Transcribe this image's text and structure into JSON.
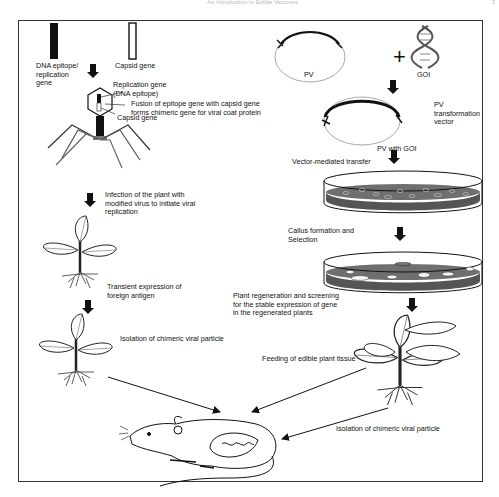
{
  "page": {
    "running_header": "An Introduction to Edible Vaccines",
    "page_number": "3"
  },
  "left_pathway": {
    "dna_epitope_label": [
      "DNA epitope/",
      "replication",
      "gene"
    ],
    "capsid_gene_label": "Capsid gene",
    "replication_gene_label": [
      "Replication gene",
      "(DNA epitope)"
    ],
    "fusion_label": [
      "Fusion of epitope gene with capsid gene",
      "forms chimeric gene for viral coat protein"
    ],
    "capsid_gene_inner_label": "Capsid gene",
    "infection_label": [
      "Infection of the plant with",
      "modified virus to initiate viral",
      "replication"
    ],
    "transient_label": [
      "Transient expression of",
      "foreign antigen"
    ],
    "isolation_label": "Isolation of chimeric viral particle"
  },
  "right_pathway": {
    "pv_label": "PV",
    "plus_sign": "+",
    "goi_label": "GOI",
    "pv_transformation_label": [
      "PV",
      "transformation",
      "vector"
    ],
    "pv_with_goi_label": "PV with GOI",
    "vector_transfer_label": "Vector-mediated transfer",
    "callus_label": [
      "Callus formation and",
      "Selection"
    ],
    "regeneration_label": [
      "Plant regeneration and screening",
      "for the stable expression of gene",
      "in the regenerated plants"
    ],
    "feeding_label": "Feeding of edible plant tissue",
    "isolation_label": "Isolation of chimeric viral particle"
  },
  "colors": {
    "frame": "#333333",
    "ink": "#111111",
    "medium": "#6f6f6f",
    "medium_dark": "#555555",
    "arrow": "#111111"
  }
}
